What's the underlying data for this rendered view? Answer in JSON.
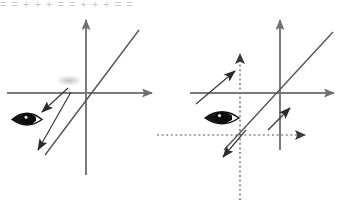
{
  "page": {
    "width": 351,
    "height": 204,
    "background": "#ffffff",
    "cropped_header_text": "= = + + + = = + + + = ="
  },
  "colors": {
    "axis_solid": "#7a7a7a",
    "axis_dotted": "#8a8a8a",
    "line_dark": "#4a4a4a",
    "arrow_dark": "#2b2b2b",
    "eye_dark": "#1a1a1a",
    "smudge_gray": "#c8c8c8"
  },
  "panels": [
    {
      "id": "left-panel",
      "name": "left-diagram",
      "origin": {
        "x": 86,
        "y": 93
      },
      "axes": [
        {
          "name": "horizontal-axis",
          "style": "solid",
          "from": {
            "x": 7,
            "y": 93
          },
          "to": {
            "x": 158,
            "y": 93
          },
          "arrow": "end"
        },
        {
          "name": "vertical-axis",
          "style": "solid",
          "from": {
            "x": 86,
            "y": 175
          },
          "to": {
            "x": 86,
            "y": 14
          },
          "arrow": "end"
        }
      ],
      "lines": [
        {
          "name": "worldline-diagonal",
          "style": "solid",
          "from": {
            "x": 45,
            "y": 155
          },
          "to": {
            "x": 139,
            "y": 30
          }
        }
      ],
      "arrows": [
        {
          "name": "incoming-ray-arrow",
          "from": {
            "x": 68,
            "y": 88
          },
          "to": {
            "x": 39,
            "y": 115
          }
        },
        {
          "name": "outgoing-ray-arrow",
          "from": {
            "x": 71,
            "y": 92
          },
          "to": {
            "x": 35,
            "y": 155
          }
        }
      ],
      "eye": {
        "name": "observer-eye",
        "x": 12,
        "y": 110,
        "w": 31,
        "h": 19
      },
      "smudge": {
        "name": "faint-smudge",
        "x": 55,
        "y": 75,
        "w": 28,
        "h": 11
      }
    },
    {
      "id": "right-panel",
      "name": "right-diagram",
      "origin": {
        "x": 280,
        "y": 93
      },
      "dotted_origin": {
        "x": 240,
        "y": 135
      },
      "axes": [
        {
          "name": "horizontal-axis",
          "style": "solid",
          "from": {
            "x": 190,
            "y": 93
          },
          "to": {
            "x": 340,
            "y": 93
          },
          "arrow": "end"
        },
        {
          "name": "vertical-axis",
          "style": "solid",
          "from": {
            "x": 280,
            "y": 150
          },
          "to": {
            "x": 280,
            "y": 14
          },
          "arrow": "end"
        },
        {
          "name": "primed-horizontal-axis",
          "style": "dotted",
          "from": {
            "x": 157,
            "y": 135
          },
          "to": {
            "x": 313,
            "y": 135
          },
          "arrow": "end"
        },
        {
          "name": "primed-vertical-axis",
          "style": "dotted",
          "from": {
            "x": 240,
            "y": 200
          },
          "to": {
            "x": 240,
            "y": 48
          },
          "arrow": "end"
        }
      ],
      "lines": [
        {
          "name": "worldline-diagonal",
          "style": "solid",
          "from": {
            "x": 224,
            "y": 150
          },
          "to": {
            "x": 333,
            "y": 32
          }
        }
      ],
      "arrows": [
        {
          "name": "upper-left-ray-arrow",
          "from": {
            "x": 196,
            "y": 104
          },
          "to": {
            "x": 238,
            "y": 68
          }
        },
        {
          "name": "lower-right-ray-arrow",
          "from": {
            "x": 268,
            "y": 130
          },
          "to": {
            "x": 292,
            "y": 105
          }
        },
        {
          "name": "down-left-ray-arrow",
          "from": {
            "x": 246,
            "y": 130
          },
          "to": {
            "x": 220,
            "y": 160
          }
        }
      ],
      "eye": {
        "name": "observer-eye",
        "x": 205,
        "y": 108,
        "w": 34,
        "h": 20
      }
    }
  ]
}
